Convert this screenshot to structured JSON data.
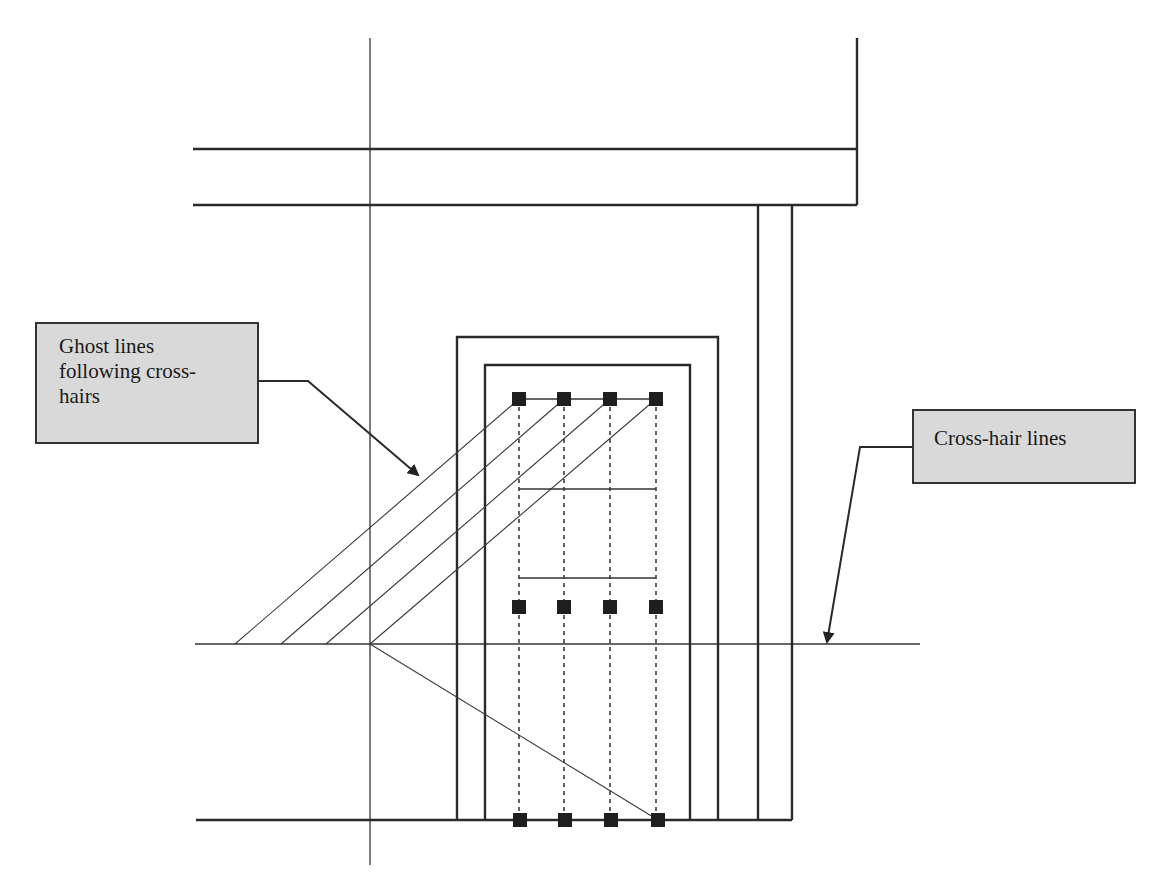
{
  "diagram": {
    "title": "",
    "callouts": {
      "ghost_lines": {
        "lines": [
          "Ghost lines",
          "following cross-",
          "hairs"
        ],
        "text": "Ghost lines following cross-hairs"
      },
      "cross_hair": {
        "lines": [
          "Cross-hair lines"
        ],
        "text": "Cross-hair lines"
      }
    },
    "colors": {
      "stroke": "#2a2a2a",
      "callout_fill": "#d9d9d9",
      "callout_border": "#333333",
      "node_fill": "#1e1e1e",
      "background": "#ffffff"
    },
    "geometry": {
      "crosshair_vertical_x": 370,
      "crosshair_horizontal_y": 644,
      "top_beam": {
        "x1": 193,
        "x2": 857,
        "y_top": 149,
        "y_bottom": 205
      },
      "right_wall_x": 857,
      "right_wall_top_y": 38,
      "columns_x": [
        758,
        792
      ],
      "floor_y": 820,
      "outer_rect": {
        "x1": 457,
        "y1": 337,
        "x2": 718,
        "y2": 820
      },
      "inner_rect": {
        "x1": 485,
        "y1": 365,
        "x2": 690,
        "y2": 820
      },
      "node_columns_x": [
        519,
        564,
        610,
        656
      ],
      "node_rows_y": [
        399,
        607,
        820
      ],
      "inner_bars_y": [
        489,
        578
      ],
      "ghost_line_bases_x": [
        235,
        281,
        326,
        370
      ]
    }
  }
}
